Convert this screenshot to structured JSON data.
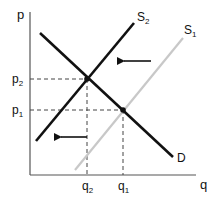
{
  "diagram": {
    "type": "supply-demand",
    "axes": {
      "y_label": "p",
      "x_label": "q"
    },
    "price_labels": [
      {
        "base": "p",
        "sub": "2",
        "y": 79
      },
      {
        "base": "p",
        "sub": "1",
        "y": 110
      }
    ],
    "quantity_labels": [
      {
        "base": "q",
        "sub": "2",
        "x": 87
      },
      {
        "base": "q",
        "sub": "1",
        "x": 123
      }
    ],
    "curves": [
      {
        "name": "S2",
        "base": "S",
        "sub": "2",
        "color": "#111111"
      },
      {
        "name": "S1",
        "base": "S",
        "sub": "1",
        "color": "#c8c8c8"
      },
      {
        "name": "D",
        "base": "D",
        "sub": "",
        "color": "#111111"
      }
    ],
    "equilibria": [
      {
        "name": "E2",
        "p": "p2",
        "q": "q2"
      },
      {
        "name": "E1",
        "p": "p1",
        "q": "q1"
      }
    ],
    "shift_direction": "left",
    "colors": {
      "axis": "#555555",
      "dashed": "#444444",
      "curve_dark": "#111111",
      "curve_light": "#c8c8c8"
    }
  }
}
